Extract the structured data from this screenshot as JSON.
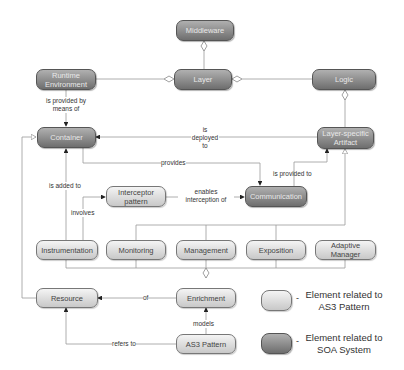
{
  "diagram": {
    "nodes": {
      "middleware": "Middleware",
      "layer": "Layer",
      "runtime_environment": "Runtime Environment",
      "logic": "Logic",
      "container": "Container",
      "layer_specific_artifact": "Layer-specific Artifact",
      "interceptor_pattern": "Interceptor pattern",
      "communication": "Communication",
      "instrumentation": "Instrumentation",
      "monitoring": "Monitoring",
      "management": "Management",
      "exposition": "Exposition",
      "adaptive_manager": "Adaptive Manager",
      "resource": "Resource",
      "enrichment": "Enrichment",
      "as3_pattern": "AS3 Pattern"
    },
    "edge_labels": {
      "is_provided_by_means_of": "is provided by means of",
      "is_deployed_to": "is deployed to",
      "provides": "provides",
      "is_provided_to": "is provided to",
      "is_added_to": "is added to",
      "enables_interception_of": "enables interception of",
      "involves": "involves",
      "of": "of",
      "models": "models",
      "refers_to": "refers to"
    },
    "legend": {
      "as3_label": "Element related to AS3 Pattern",
      "soa_label": "Element related to SOA System",
      "dash": "-"
    },
    "colors": {
      "soa_fill_top": "#b0b0b0",
      "soa_fill_bottom": "#6e6e6e",
      "as3_fill_top": "#f4f4f4",
      "as3_fill_bottom": "#c8c8c8",
      "line": "#999999"
    }
  }
}
